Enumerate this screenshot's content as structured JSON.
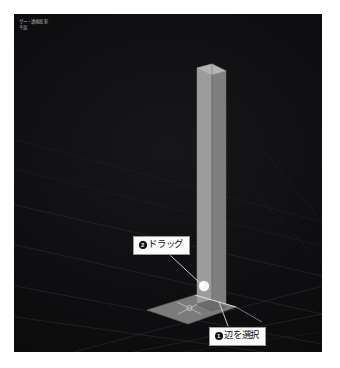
{
  "viewport": {
    "overlay_line1": "ザー・透視投影",
    "overlay_line2": "平面",
    "background_color": "#0d0d0e",
    "grid_color": "#2e2e30"
  },
  "callouts": [
    {
      "id": "drag",
      "badge": "❶",
      "number": "2",
      "label": "ドラッグ",
      "full_text": "❷ドラッグ"
    },
    {
      "id": "select-edge",
      "badge": "❶",
      "number": "1",
      "label": "辺を選択",
      "full_text": "❶辺を選択"
    }
  ],
  "callout_labels": {
    "drag": "ドラッグ",
    "drag_number": "2",
    "select_edge": "辺を選択",
    "select_edge_number": "1"
  },
  "geometry": {
    "object_name": "平面",
    "column_face_left_color": "#9a9a9a",
    "column_face_right_color": "#7e7e7e",
    "base_plane_color": "#8d8d8d",
    "handle_color": "#f2f2f2"
  }
}
